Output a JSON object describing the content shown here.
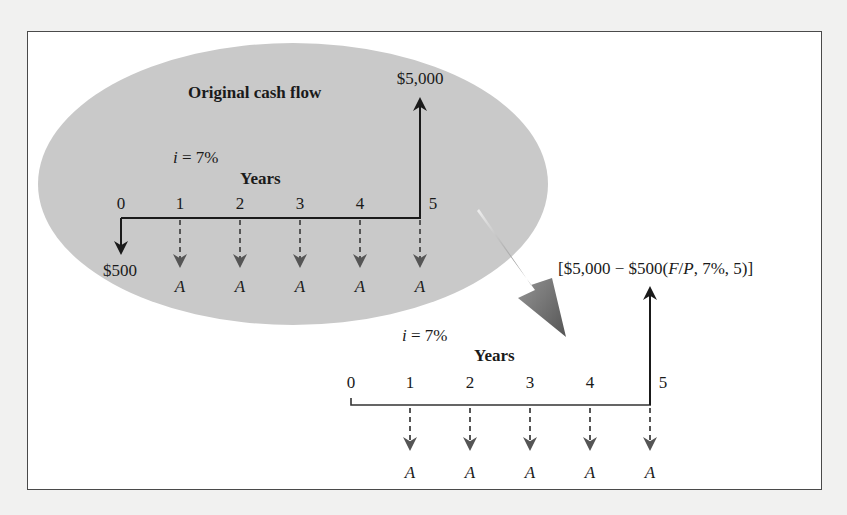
{
  "colors": {
    "page_bg": "#f1f1f0",
    "frame_bg": "#ffffff",
    "frame_border": "#4a4a4a",
    "ellipse_fill": "#c9c9c9",
    "axis": "#1a1a1a",
    "dashed_arrow": "#555555",
    "transition_arrow": "#6e6e6e"
  },
  "original": {
    "title": "Original cash flow",
    "interest_label_i": "i",
    "interest_label_rest": " = 7%",
    "axis_label": "Years",
    "ticks": [
      "0",
      "1",
      "2",
      "3",
      "4",
      "5"
    ],
    "receipt_label": "$5,000",
    "deposit_label": "$500",
    "annuity_labels": [
      "A",
      "A",
      "A",
      "A",
      "A"
    ]
  },
  "equivalent": {
    "interest_label_i": "i",
    "interest_label_rest": " = 7%",
    "axis_label": "Years",
    "ticks": [
      "0",
      "1",
      "2",
      "3",
      "4",
      "5"
    ],
    "formula_prefix": "[$5,000 − $500(",
    "formula_F": "F",
    "formula_slash": "/",
    "formula_P": "P",
    "formula_suffix": ", 7%, 5)]",
    "annuity_labels": [
      "A",
      "A",
      "A",
      "A",
      "A"
    ]
  }
}
